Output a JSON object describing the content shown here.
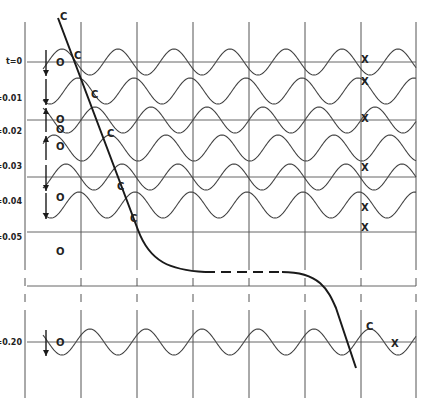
{
  "figure": {
    "colors": {
      "background": "#ffffff",
      "grid": "#555555",
      "wave": "#444444",
      "locus": "#1a1a1a",
      "text": "#222222"
    },
    "rows": [
      {
        "label": "t=0",
        "time": 0.0,
        "o_marker": "O",
        "x_marker": "X",
        "crest_marker": "C",
        "arrow": "down"
      },
      {
        "label": "t=0.01",
        "time": 0.01,
        "o_marker": "O",
        "x_marker": "X",
        "crest_marker": "C",
        "arrow": "down"
      },
      {
        "label": "t=0.02",
        "time": 0.02,
        "o_marker": "O",
        "x_marker": "X",
        "crest_marker": "C",
        "arrow": "up"
      },
      {
        "label": "t=0.03",
        "time": 0.03,
        "o_marker": "O",
        "x_marker": "X",
        "crest_marker": "C",
        "arrow": "up"
      },
      {
        "label": "t=0.04",
        "time": 0.04,
        "o_marker": "O",
        "x_marker": "X",
        "crest_marker": "C",
        "arrow": "down"
      },
      {
        "label": "t=0.05",
        "time": 0.05,
        "o_marker": "O",
        "x_marker": "X",
        "crest_marker": "C",
        "arrow": "down"
      },
      {
        "label": "t=0.20",
        "time": 0.2,
        "o_marker": "O",
        "x_marker": "X",
        "crest_marker": "C",
        "arrow": "down"
      }
    ],
    "grid_columns": 7,
    "wavelengths_per_column": 1,
    "locus_gap_dashed": true
  }
}
